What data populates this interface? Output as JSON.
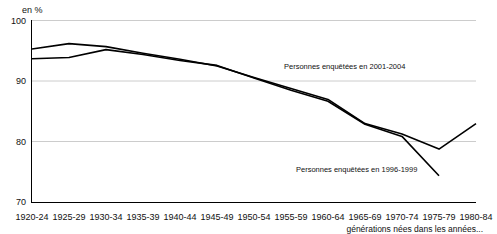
{
  "chart_data": {
    "type": "line",
    "title": "",
    "subtitle": "",
    "xlabel": "générations nées dans les années...",
    "ylabel": "en %",
    "ylim": [
      70,
      100
    ],
    "yticks": [
      70,
      80,
      90,
      100
    ],
    "grid": true,
    "legend_position": "inline-annotations",
    "categories": [
      "1920-24",
      "1925-29",
      "1930-34",
      "1935-39",
      "1940-44",
      "1945-49",
      "1950-54",
      "1955-59",
      "1960-64",
      "1965-69",
      "1970-74",
      "1975-79",
      "1980-84"
    ],
    "series": [
      {
        "name": "Personnes enquêtées en 2001-2004",
        "values": [
          95.3,
          96.2,
          95.7,
          94.6,
          93.6,
          92.5,
          90.6,
          88.8,
          87.0,
          83.0,
          81.3,
          78.8,
          83.0
        ]
      },
      {
        "name": "Personnes enquêtées en 1996-1999",
        "values": [
          93.7,
          93.9,
          95.2,
          94.4,
          93.4,
          92.6,
          90.5,
          88.5,
          86.7,
          82.9,
          80.9,
          74.4,
          null
        ]
      }
    ],
    "annotations": [
      {
        "text": "Personnes enquêtées en 2001-2004",
        "x_pct": 59.0,
        "y_pct": 28.0
      },
      {
        "text": "Personnes enquêtées en 1996-1999",
        "x_pct": 61.5,
        "y_pct": 80.5
      }
    ],
    "line_color": "#000000"
  }
}
